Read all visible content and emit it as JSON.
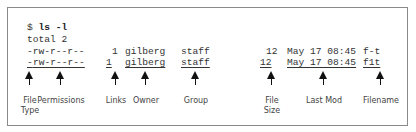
{
  "terminal": {
    "prompt": "$ ",
    "command": "ls -l",
    "total_line": "total 2",
    "rows": [
      {
        "perms": "-rw-r--r--",
        "links": "1",
        "owner": "gilberg",
        "group": "staff",
        "size": "12",
        "date": "May 17 08:45",
        "name": "f-t"
      },
      {
        "type": "-",
        "perms_rest": "rw-r--r--",
        "links": "1",
        "owner": "gilberg",
        "group": "staff",
        "size": "12",
        "date": "May 17 08:45",
        "name": "f1t"
      }
    ]
  },
  "labels": {
    "file_type": "File\nType",
    "permissions": "Permissions",
    "links": "Links",
    "owner": "Owner",
    "group": "Group",
    "file_size": "File\nSize",
    "last_mod": "Last Mod",
    "filename": "Filename"
  }
}
